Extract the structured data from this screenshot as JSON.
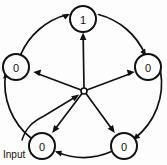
{
  "figure": {
    "background_color": "#fdfdfd",
    "line_color": "#111111",
    "width": 167,
    "height": 165
  },
  "diagram": {
    "type": "state-ring",
    "node_count": 5,
    "hub": {
      "name": "center-hub",
      "label": "",
      "cx": 84,
      "cy": 91,
      "r": 3
    },
    "nodes": [
      {
        "id": "n-top",
        "label": "1",
        "cx": 83,
        "cy": 19,
        "r": 13,
        "position": "top"
      },
      {
        "id": "n-right",
        "label": "0",
        "cx": 148,
        "cy": 67,
        "r": 13,
        "position": "right"
      },
      {
        "id": "n-bottom-right",
        "label": "0",
        "cx": 124,
        "cy": 146,
        "r": 13,
        "position": "bottom-right"
      },
      {
        "id": "n-bottom-left",
        "label": "0",
        "cx": 42,
        "cy": 146,
        "r": 13,
        "position": "bottom-left"
      },
      {
        "id": "n-left",
        "label": "0",
        "cx": 16,
        "cy": 67,
        "r": 13,
        "position": "left"
      }
    ],
    "ring_edges": [
      {
        "id": "e-left-top",
        "from": "n-left",
        "to": "n-top",
        "direction": "clockwise"
      },
      {
        "id": "e-top-right",
        "from": "n-top",
        "to": "n-right",
        "direction": "clockwise"
      },
      {
        "id": "e-right-bottomright",
        "from": "n-right",
        "to": "n-bottom-right",
        "direction": "clockwise"
      },
      {
        "id": "e-bottomright-bottomleft",
        "from": "n-bottom-right",
        "to": "n-bottom-left",
        "direction": "clockwise"
      },
      {
        "id": "e-bottomleft-left",
        "from": "n-bottom-left",
        "to": "n-left",
        "direction": "clockwise"
      }
    ],
    "spokes": [
      {
        "id": "s-hub-top",
        "from": "center-hub",
        "to": "n-top"
      },
      {
        "id": "s-hub-right",
        "from": "center-hub",
        "to": "n-right"
      },
      {
        "id": "s-hub-bottom-right",
        "from": "center-hub",
        "to": "n-bottom-right"
      },
      {
        "id": "s-hub-bottom-left",
        "from": "center-hub",
        "to": "n-bottom-left"
      },
      {
        "id": "s-hub-left",
        "from": "center-hub",
        "to": "n-left"
      }
    ],
    "input": {
      "label": "Input",
      "target": "center-hub",
      "label_x": 3,
      "label_y": 154
    }
  }
}
